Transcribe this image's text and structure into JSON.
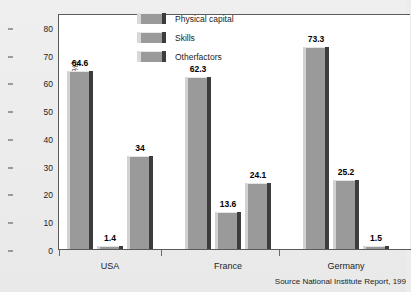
{
  "chart_data": {
    "type": "bar",
    "title": "",
    "xlabel": "",
    "ylabel": "Contribution of the gap (%)",
    "ylim": [
      0,
      85
    ],
    "yticks": [
      0,
      10,
      20,
      30,
      40,
      50,
      60,
      70,
      80
    ],
    "ytick_labels": [
      "0",
      "10",
      "20",
      "30",
      "40",
      "50",
      "60",
      "70",
      "80"
    ],
    "grid": false,
    "legend_position": "top-center",
    "categories": [
      "USA",
      "France",
      "Germany"
    ],
    "series": [
      {
        "name": "Physical capital",
        "values": [
          64.6,
          62.3,
          73.3
        ],
        "labels": [
          "64.6",
          "62.3",
          "73.3"
        ]
      },
      {
        "name": "Skills",
        "values": [
          1.4,
          13.6,
          25.2
        ],
        "labels": [
          "1.4",
          "13.6",
          "25.2"
        ]
      },
      {
        "name": "Otherfactors",
        "values": [
          34,
          24.1,
          1.5
        ],
        "labels": [
          "34",
          "24.1",
          "1.5"
        ]
      }
    ],
    "annotations": {
      "source": "Source  National Institute Report, 199"
    },
    "colors": {
      "bar_face": "#9a9a9a",
      "bar_highlight": "#d2d2d2",
      "bar_shadow": "#3c3c3c",
      "plot_background": "#ffffff",
      "figure_background": "#ececed",
      "axis": "#5a5a5a",
      "text": "#1d1d1d"
    }
  },
  "legend": {
    "items": [
      {
        "label": "Physical capital"
      },
      {
        "label": "Skills"
      },
      {
        "label": "Otherfactors"
      }
    ]
  },
  "axis": {
    "y_title": "Contribution of the gap (%)"
  },
  "footer": {
    "source": "Source  National Institute Report, 199"
  }
}
